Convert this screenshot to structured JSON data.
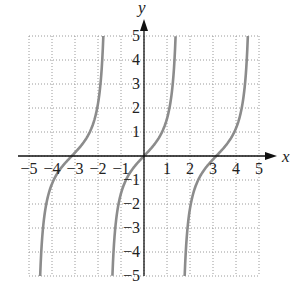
{
  "chart_data": {
    "type": "line",
    "title": "",
    "function": "y = tan(x)",
    "xlabel": "x",
    "ylabel": "y",
    "xlim": [
      -5,
      5
    ],
    "ylim": [
      -5,
      5
    ],
    "grid": true,
    "grid_style": "dotted",
    "x_ticks": [
      "−5",
      "−4",
      "−3",
      "−2",
      "−1",
      "1",
      "2",
      "3",
      "4",
      "5"
    ],
    "x_tick_values": [
      -5,
      -4,
      -3,
      -2,
      -1,
      1,
      2,
      3,
      4,
      5
    ],
    "y_ticks": [
      "5",
      "4",
      "3",
      "2",
      "1",
      "−1",
      "−2",
      "−3",
      "−4",
      "−5"
    ],
    "y_tick_values": [
      5,
      4,
      3,
      2,
      1,
      -1,
      -2,
      -3,
      -4,
      -5
    ],
    "series": [
      {
        "name": "tan(x) branch 1",
        "x_range": [
          -4.515,
          -1.768
        ],
        "zero_at": -3.1416
      },
      {
        "name": "tan(x) branch 2",
        "x_range": [
          -1.373,
          1.373
        ],
        "zero_at": 0
      },
      {
        "name": "tan(x) branch 3",
        "x_range": [
          1.768,
          4.515
        ],
        "zero_at": 3.1416
      }
    ],
    "asymptotes": [
      -4.712,
      -1.571,
      1.571,
      4.712
    ],
    "curve_color": "#8c8c8c",
    "axis_color": "#111111",
    "grid_color": "#9a9a9a"
  }
}
